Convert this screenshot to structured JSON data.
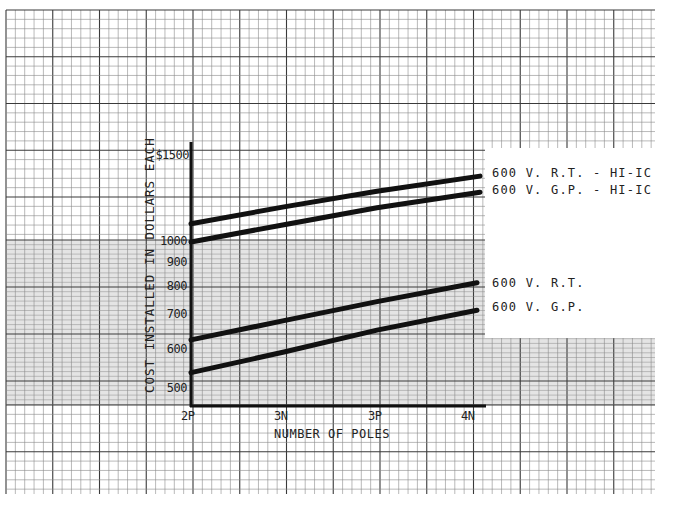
{
  "chart_data": {
    "type": "line",
    "title": "",
    "xlabel": "NUMBER OF POLES",
    "ylabel": "COST INSTALLED IN DOLLARS EACH",
    "yscale": "log",
    "categories": [
      "2P",
      "3N",
      "3P",
      "4N"
    ],
    "y_ticks": [
      "$1500",
      "1000",
      "900",
      "800",
      "700",
      "600",
      "500"
    ],
    "ylim": [
      460,
      1600
    ],
    "grid": true,
    "legend_position": "right (inline labels at line ends)",
    "series": [
      {
        "name": "600 V. R.T. - HI-IC",
        "values": [
          1090,
          1180,
          1270,
          1365
        ]
      },
      {
        "name": "600 V. G.P. - HI-IC",
        "values": [
          1000,
          1085,
          1175,
          1265
        ]
      },
      {
        "name": "600 V. R.T.",
        "values": [
          630,
          690,
          755,
          825
        ]
      },
      {
        "name": "600 V. G.P.",
        "values": [
          540,
          595,
          660,
          725
        ]
      }
    ]
  },
  "axis": {
    "y_title": "COST INSTALLED IN DOLLARS EACH",
    "x_title": "NUMBER OF POLES",
    "y_ticks": [
      "$1500",
      "1000",
      "900",
      "800",
      "700",
      "600",
      "500"
    ],
    "x_ticks": [
      "2P",
      "3N",
      "3P",
      "4N"
    ]
  },
  "legend": {
    "items": [
      "600 V. R.T. - HI-IC",
      "600 V. G.P. - HI-IC",
      "600 V. R.T.",
      "600 V. G.P."
    ]
  },
  "colors": {
    "grid_major": "#3a3a3a",
    "grid_minor": "#8a8a8a",
    "shaded_band": "#e2e2e2",
    "ink": "#111111"
  }
}
